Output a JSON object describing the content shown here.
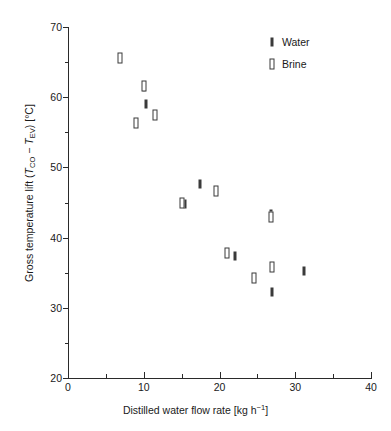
{
  "chart_data": {
    "type": "scatter",
    "title": "",
    "xlabel": "Distilled water flow rate [kg h−1]",
    "xlabel_parts": {
      "text": "Distilled water flow rate [kg h",
      "sup": "−1",
      "tail": "]"
    },
    "ylabel": "Gross temperature lift (TCO − TEV) [°C]",
    "ylabel_parts": {
      "lead": "Gross temperature lift (",
      "sym1": "T",
      "sub1": "CO",
      "mid": " − ",
      "sym2": "T",
      "sub2": "EV",
      "tail": ") [°C]"
    },
    "xlim": [
      0,
      40
    ],
    "ylim": [
      20,
      70
    ],
    "x_ticks_major": [
      0,
      10,
      20,
      30,
      40
    ],
    "x_ticks_minor": [
      5,
      15,
      25,
      35
    ],
    "y_ticks_major": [
      20,
      30,
      40,
      50,
      60,
      70
    ],
    "y_ticks_minor": [
      25,
      35,
      45,
      55,
      65
    ],
    "grid": false,
    "legend_position": "top-right",
    "marker_color": "#3a3a3a",
    "axis_color": "#2a2a2a",
    "series": [
      {
        "name": "Water",
        "marker": "filled-bar",
        "points": [
          {
            "x": 10.0,
            "y": 61.4
          },
          {
            "x": 10.3,
            "y": 59.0
          },
          {
            "x": 15.5,
            "y": 44.8
          },
          {
            "x": 17.4,
            "y": 47.6
          },
          {
            "x": 22.0,
            "y": 37.4
          },
          {
            "x": 26.8,
            "y": 43.4
          },
          {
            "x": 26.9,
            "y": 32.2
          },
          {
            "x": 31.2,
            "y": 35.2
          }
        ]
      },
      {
        "name": "Brine",
        "marker": "open-bar",
        "points": [
          {
            "x": 6.9,
            "y": 65.6
          },
          {
            "x": 9.0,
            "y": 56.3
          },
          {
            "x": 10.0,
            "y": 61.6
          },
          {
            "x": 11.5,
            "y": 57.5
          },
          {
            "x": 15.0,
            "y": 45.0
          },
          {
            "x": 19.6,
            "y": 46.7
          },
          {
            "x": 21.0,
            "y": 37.8
          },
          {
            "x": 24.5,
            "y": 34.3
          },
          {
            "x": 26.8,
            "y": 43.0
          },
          {
            "x": 26.9,
            "y": 35.8
          }
        ]
      }
    ],
    "legend": [
      {
        "label": "Water",
        "marker": "filled-bar"
      },
      {
        "label": "Brine",
        "marker": "open-bar"
      }
    ]
  }
}
